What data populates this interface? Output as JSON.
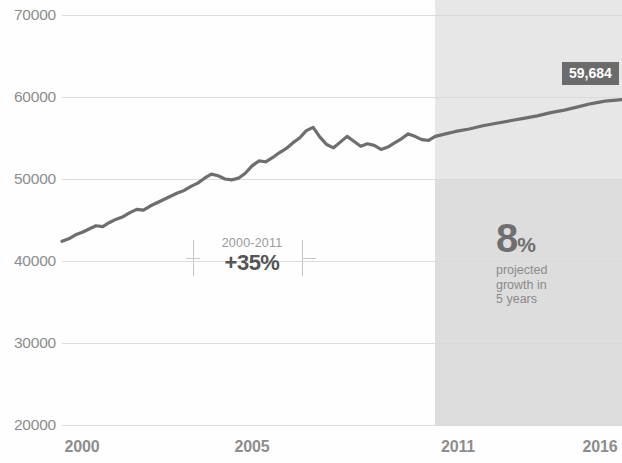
{
  "chart_data": {
    "type": "line",
    "title": "",
    "subtitle": "",
    "xlabel": "",
    "ylabel": "",
    "xlim": [
      2000,
      2016.5
    ],
    "ylim": [
      20000,
      70000
    ],
    "grid": true,
    "legend": "none",
    "y_ticks": [
      70000,
      60000,
      50000,
      40000,
      30000,
      20000
    ],
    "y_tick_labels": [
      "70000",
      "60000",
      "50000",
      "40000",
      "30000",
      "20000"
    ],
    "x_ticks": [
      2000,
      2005,
      2011,
      2016
    ],
    "x_tick_labels": [
      "2000",
      "2005",
      "2011",
      "2016"
    ],
    "line_color": "#6e6e6e",
    "projection_band_color": "#e3e3e3",
    "projection_start_year": 2011,
    "projection_end_year": 2016.5,
    "series": [
      {
        "name": "value",
        "x": [
          2000.0,
          2000.2,
          2000.4,
          2000.6,
          2000.8,
          2001.0,
          2001.2,
          2001.4,
          2001.6,
          2001.8,
          2002.0,
          2002.2,
          2002.4,
          2002.6,
          2002.8,
          2003.0,
          2003.2,
          2003.4,
          2003.6,
          2003.8,
          2004.0,
          2004.2,
          2004.4,
          2004.6,
          2004.8,
          2005.0,
          2005.2,
          2005.4,
          2005.6,
          2005.8,
          2006.0,
          2006.2,
          2006.4,
          2006.6,
          2006.8,
          2007.0,
          2007.2,
          2007.4,
          2007.6,
          2007.8,
          2008.0,
          2008.2,
          2008.4,
          2008.6,
          2008.8,
          2009.0,
          2009.2,
          2009.4,
          2009.6,
          2009.8,
          2010.0,
          2010.2,
          2010.4,
          2010.6,
          2010.8,
          2011.0,
          2011.3,
          2011.6,
          2012.0,
          2012.4,
          2012.8,
          2013.2,
          2013.6,
          2014.0,
          2014.4,
          2014.8,
          2015.2,
          2015.6,
          2016.0,
          2016.5
        ],
        "y": [
          42400,
          42700,
          43200,
          43500,
          43900,
          44300,
          44200,
          44700,
          45100,
          45400,
          45900,
          46300,
          46200,
          46700,
          47100,
          47500,
          47900,
          48300,
          48600,
          49100,
          49500,
          50100,
          50600,
          50400,
          50000,
          49900,
          50100,
          50700,
          51600,
          52200,
          52100,
          52600,
          53200,
          53700,
          54400,
          55000,
          55900,
          56300,
          55100,
          54200,
          53800,
          54500,
          55200,
          54600,
          54000,
          54300,
          54100,
          53600,
          53900,
          54400,
          54900,
          55500,
          55200,
          54800,
          54700,
          55200,
          55500,
          55800,
          56100,
          56500,
          56800,
          57100,
          57400,
          57700,
          58100,
          58400,
          58800,
          59200,
          59500,
          59684
        ]
      }
    ],
    "annotations": [
      {
        "id": "growth-2000-2011",
        "range_label": "2000-2011",
        "value_label": "+35%"
      },
      {
        "id": "projection",
        "big_number": "8",
        "percent_sign": "%",
        "caption_line_1": "projected",
        "caption_line_2": "growth in",
        "caption_line_3": "5 years"
      },
      {
        "id": "end-value",
        "label": "59,684"
      }
    ]
  },
  "axis": {
    "y_labels": [
      "70000",
      "60000",
      "50000",
      "40000",
      "30000",
      "20000"
    ],
    "x_labels": [
      "2000",
      "2005",
      "2011",
      "2016"
    ]
  },
  "growth_annotation": {
    "range": "2000-2011",
    "percent": "+35%"
  },
  "projection": {
    "number": "8",
    "sign": "%",
    "line1": "projected",
    "line2": "growth in",
    "line3": "5 years"
  },
  "end_value": {
    "label": "59,684"
  }
}
